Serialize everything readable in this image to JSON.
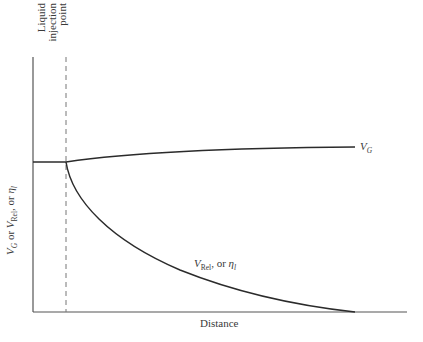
{
  "diagram": {
    "x_axis_label": "Distance",
    "y_axis_label": {
      "v_g": "V",
      "v_g_sub": "G",
      "or1": " or ",
      "v_rel": "V",
      "v_rel_sub": "Rel",
      "or2": ", or ",
      "eta": "η",
      "eta_sub": "l"
    },
    "injection_label": {
      "line1": "Liquid",
      "line2": "injection",
      "line3": "point"
    },
    "curve_labels": {
      "gas": {
        "main": "V",
        "sub": "G"
      },
      "rel": {
        "main": "V",
        "sub": "Rel",
        "mid": ", or ",
        "eta": "η",
        "eta_sub": "l"
      }
    },
    "colors": {
      "line": "#2b2b2b",
      "axis": "#555555",
      "dashed": "#777777"
    }
  }
}
